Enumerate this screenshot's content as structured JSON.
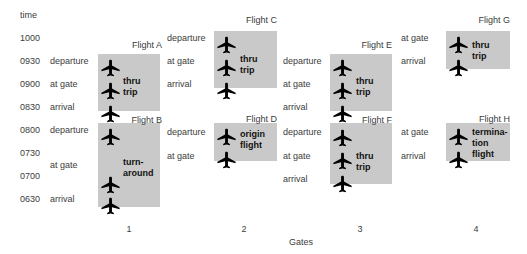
{
  "diagram": {
    "background": "#ffffff",
    "box_color": "#c9c9c9",
    "label_color": "#3c3c3c",
    "plane_color": "#000000"
  },
  "time_axis": {
    "header": "time",
    "x": 20,
    "header_y": 15,
    "ticks": [
      {
        "label": "1000",
        "y": 38
      },
      {
        "label": "0930",
        "y": 61
      },
      {
        "label": "0900",
        "y": 84
      },
      {
        "label": "0830",
        "y": 107
      },
      {
        "label": "0800",
        "y": 130
      },
      {
        "label": "0730",
        "y": 153
      },
      {
        "label": "0700",
        "y": 176
      },
      {
        "label": "0630",
        "y": 199
      }
    ]
  },
  "event_labels": [
    {
      "text": "departure",
      "x": 50,
      "y": 61
    },
    {
      "text": "at gate",
      "x": 50,
      "y": 84
    },
    {
      "text": "arrival",
      "x": 50,
      "y": 107
    },
    {
      "text": "departure",
      "x": 50,
      "y": 130
    },
    {
      "text": "at gate",
      "x": 50,
      "y": 165
    },
    {
      "text": "arrival",
      "x": 50,
      "y": 199
    },
    {
      "text": "departure",
      "x": 167,
      "y": 38
    },
    {
      "text": "at gate",
      "x": 167,
      "y": 61
    },
    {
      "text": "arrival",
      "x": 167,
      "y": 84
    },
    {
      "text": "departure",
      "x": 167,
      "y": 132
    },
    {
      "text": "at gate",
      "x": 167,
      "y": 156
    },
    {
      "text": "departure",
      "x": 283,
      "y": 61
    },
    {
      "text": "at gate",
      "x": 283,
      "y": 84
    },
    {
      "text": "arrival",
      "x": 283,
      "y": 107
    },
    {
      "text": "departure",
      "x": 283,
      "y": 132
    },
    {
      "text": "at gate",
      "x": 283,
      "y": 156
    },
    {
      "text": "arrival",
      "x": 283,
      "y": 179
    },
    {
      "text": "at gate",
      "x": 401,
      "y": 38
    },
    {
      "text": "arrival",
      "x": 401,
      "y": 61
    },
    {
      "text": "at gate",
      "x": 401,
      "y": 132
    },
    {
      "text": "arrival",
      "x": 401,
      "y": 156
    }
  ],
  "flights": [
    {
      "name": "Flight A",
      "type_lines": [
        "thru",
        "trip"
      ],
      "gate": "1",
      "label_right": 162,
      "label_y": 45,
      "box": {
        "x": 98,
        "y": 54,
        "w": 62,
        "h": 57
      },
      "planes_y": [
        68,
        91,
        114
      ],
      "plane_cx": 111,
      "text_x": 123,
      "text_cy": 87
    },
    {
      "name": "Flight B",
      "type_lines": [
        "turn-",
        "around"
      ],
      "gate": "1",
      "label_right": 162,
      "label_y": 120,
      "box": {
        "x": 98,
        "y": 123,
        "w": 62,
        "h": 84
      },
      "planes_y": [
        137,
        185,
        206
      ],
      "plane_cx": 111,
      "text_x": 123,
      "text_cy": 168
    },
    {
      "name": "Flight C",
      "type_lines": [
        "thru",
        "trip"
      ],
      "gate": "2",
      "label_right": 277,
      "label_y": 20,
      "box": {
        "x": 214,
        "y": 31,
        "w": 63,
        "h": 57
      },
      "planes_y": [
        45,
        68,
        91
      ],
      "plane_cx": 227,
      "text_x": 240,
      "text_cy": 65
    },
    {
      "name": "Flight D",
      "type_lines": [
        "origin",
        "flight"
      ],
      "gate": "2",
      "label_right": 277,
      "label_y": 119,
      "box": {
        "x": 214,
        "y": 123,
        "w": 63,
        "h": 38
      },
      "planes_y": [
        137,
        160
      ],
      "plane_cx": 227,
      "text_x": 240,
      "text_cy": 140
    },
    {
      "name": "Flight E",
      "type_lines": [
        "thru",
        "trip"
      ],
      "gate": "3",
      "label_right": 392,
      "label_y": 45,
      "box": {
        "x": 330,
        "y": 54,
        "w": 62,
        "h": 57
      },
      "planes_y": [
        68,
        91,
        114
      ],
      "plane_cx": 343,
      "text_x": 356,
      "text_cy": 87
    },
    {
      "name": "Flight F",
      "type_lines": [
        "thru",
        "trip"
      ],
      "gate": "3",
      "label_right": 392,
      "label_y": 120,
      "box": {
        "x": 330,
        "y": 123,
        "w": 62,
        "h": 61
      },
      "planes_y": [
        138,
        161,
        184
      ],
      "plane_cx": 343,
      "text_x": 356,
      "text_cy": 162
    },
    {
      "name": "Flight G",
      "type_lines": [
        "thru",
        "trip"
      ],
      "gate": "4",
      "label_right": 510,
      "label_y": 20,
      "box": {
        "x": 446,
        "y": 31,
        "w": 64,
        "h": 38
      },
      "planes_y": [
        45,
        68
      ],
      "plane_cx": 459,
      "text_x": 472,
      "text_cy": 51
    },
    {
      "name": "Flight H",
      "type_lines": [
        "termina-",
        "tion",
        "flight"
      ],
      "gate": "4",
      "label_right": 510,
      "label_y": 119,
      "box": {
        "x": 446,
        "y": 123,
        "w": 64,
        "h": 38
      },
      "planes_y": [
        137,
        160
      ],
      "plane_cx": 459,
      "text_x": 472,
      "text_cy": 143
    }
  ],
  "gates_axis": {
    "caption": "Gates",
    "caption_x": 301,
    "caption_y": 242,
    "numbers": [
      {
        "label": "1",
        "x": 129,
        "y": 229
      },
      {
        "label": "2",
        "x": 244,
        "y": 229
      },
      {
        "label": "3",
        "x": 360,
        "y": 229
      },
      {
        "label": "4",
        "x": 476,
        "y": 229
      }
    ]
  }
}
